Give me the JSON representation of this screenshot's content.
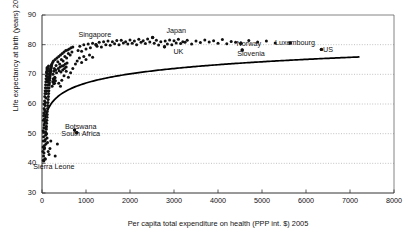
{
  "chart_data": {
    "type": "scatter",
    "title": "",
    "xlabel": "Per capita total expenditure on health (PPP int. $) 2005",
    "ylabel": "Life expectancy at birth (years) 2006",
    "xlim": [
      0,
      8000
    ],
    "ylim": [
      30,
      90
    ],
    "xticks": [
      0,
      1000,
      2000,
      3000,
      4000,
      5000,
      6000,
      7000,
      8000
    ],
    "yticks": [
      30,
      40,
      50,
      60,
      70,
      80,
      90
    ],
    "grid": "horizontal-dotted",
    "legend": "none",
    "marker_color": "#111111",
    "trend_color": "#000000",
    "trend_note": "Logarithmic fit curve rising steeply below 1000 then flattening toward 86 years at 7200",
    "annotations": [
      {
        "label": "Singapore",
        "x": 1200,
        "y": 83.5,
        "point_x": 1228,
        "point_y": 80.0
      },
      {
        "label": "Japan",
        "x": 3050,
        "y": 85.0,
        "point_x": 2514,
        "point_y": 82.4
      },
      {
        "label": "UK",
        "x": 3100,
        "y": 78.0,
        "point_x": 2784,
        "point_y": 79.3
      },
      {
        "label": "Norway",
        "x": 4700,
        "y": 80.7,
        "point_x": 4520,
        "point_y": 80.5
      },
      {
        "label": "Slovenia",
        "x": 4750,
        "y": 77.3,
        "point_x": 4550,
        "point_y": 78.2
      },
      {
        "label": "Luxembourg",
        "x": 5750,
        "y": 80.8,
        "point_x": 5640,
        "point_y": 80.6
      },
      {
        "label": "US",
        "x": 6500,
        "y": 78.6,
        "point_x": 6350,
        "point_y": 78.4
      },
      {
        "label": "Botswana",
        "x": 880,
        "y": 52.5,
        "point_x": 740,
        "point_y": 51.2
      },
      {
        "label": "South Africa",
        "x": 880,
        "y": 50.1,
        "point_x": 790,
        "point_y": 50.3
      },
      {
        "label": "Sierra Leone",
        "x": 270,
        "y": 39.2,
        "point_x": 70,
        "point_y": 41.5
      }
    ],
    "points": [
      [
        30,
        41.0
      ],
      [
        35,
        42.5
      ],
      [
        40,
        40.8
      ],
      [
        45,
        43.5
      ],
      [
        50,
        44.8
      ],
      [
        55,
        46.0
      ],
      [
        60,
        45.2
      ],
      [
        65,
        47.5
      ],
      [
        70,
        41.5
      ],
      [
        75,
        48.0
      ],
      [
        80,
        49.5
      ],
      [
        85,
        50.5
      ],
      [
        90,
        46.5
      ],
      [
        95,
        51.5
      ],
      [
        100,
        52.5
      ],
      [
        105,
        53.5
      ],
      [
        110,
        54.5
      ],
      [
        115,
        55.5
      ],
      [
        118,
        56.5
      ],
      [
        120,
        57.5
      ],
      [
        125,
        58.5
      ],
      [
        130,
        59.5
      ],
      [
        135,
        60.5
      ],
      [
        140,
        61.5
      ],
      [
        145,
        62.5
      ],
      [
        150,
        63.5
      ],
      [
        155,
        64.5
      ],
      [
        160,
        65.5
      ],
      [
        165,
        66.5
      ],
      [
        170,
        67.2
      ],
      [
        175,
        68.0
      ],
      [
        180,
        68.8
      ],
      [
        185,
        69.5
      ],
      [
        190,
        70.2
      ],
      [
        195,
        70.8
      ],
      [
        200,
        71.4
      ],
      [
        205,
        72.0
      ],
      [
        210,
        72.5
      ],
      [
        215,
        73.0
      ],
      [
        220,
        73.4
      ],
      [
        60,
        58.0
      ],
      [
        70,
        59.5
      ],
      [
        80,
        60.5
      ],
      [
        90,
        62.0
      ],
      [
        100,
        63.5
      ],
      [
        110,
        64.5
      ],
      [
        120,
        65.5
      ],
      [
        130,
        66.5
      ],
      [
        140,
        67.5
      ],
      [
        150,
        68.5
      ],
      [
        160,
        69.2
      ],
      [
        170,
        70.0
      ],
      [
        180,
        70.8
      ],
      [
        190,
        71.5
      ],
      [
        200,
        72.2
      ],
      [
        210,
        72.8
      ],
      [
        55,
        55.0
      ],
      [
        65,
        56.5
      ],
      [
        75,
        57.5
      ],
      [
        85,
        54.0
      ],
      [
        95,
        52.0
      ],
      [
        105,
        50.0
      ],
      [
        115,
        48.5
      ],
      [
        125,
        47.0
      ],
      [
        240,
        74.0
      ],
      [
        260,
        74.5
      ],
      [
        280,
        72.0
      ],
      [
        300,
        75.0
      ],
      [
        320,
        73.0
      ],
      [
        340,
        75.5
      ],
      [
        360,
        74.2
      ],
      [
        380,
        76.0
      ],
      [
        400,
        73.5
      ],
      [
        420,
        76.5
      ],
      [
        440,
        75.0
      ],
      [
        460,
        77.0
      ],
      [
        480,
        74.5
      ],
      [
        500,
        77.5
      ],
      [
        520,
        76.0
      ],
      [
        540,
        78.0
      ],
      [
        560,
        75.5
      ],
      [
        580,
        78.2
      ],
      [
        600,
        77.0
      ],
      [
        620,
        78.5
      ],
      [
        640,
        76.5
      ],
      [
        660,
        79.0
      ],
      [
        680,
        77.5
      ],
      [
        700,
        79.2
      ],
      [
        740,
        51.2
      ],
      [
        790,
        50.3
      ],
      [
        350,
        46.5
      ],
      [
        300,
        42.5
      ],
      [
        180,
        45.0
      ],
      [
        160,
        43.0
      ],
      [
        140,
        44.0
      ],
      [
        200,
        47.5
      ],
      [
        820,
        78.0
      ],
      [
        860,
        79.5
      ],
      [
        900,
        77.8
      ],
      [
        950,
        80.0
      ],
      [
        1000,
        78.5
      ],
      [
        1050,
        80.2
      ],
      [
        1100,
        79.0
      ],
      [
        1150,
        80.5
      ],
      [
        1228,
        80.0
      ],
      [
        1250,
        79.5
      ],
      [
        1300,
        80.8
      ],
      [
        1350,
        79.2
      ],
      [
        1400,
        81.0
      ],
      [
        1450,
        80.0
      ],
      [
        1500,
        81.2
      ],
      [
        1550,
        79.8
      ],
      [
        1600,
        81.0
      ],
      [
        1650,
        80.3
      ],
      [
        1700,
        81.4
      ],
      [
        1750,
        80.0
      ],
      [
        1800,
        81.5
      ],
      [
        1850,
        80.6
      ],
      [
        1900,
        81.0
      ],
      [
        1950,
        80.2
      ],
      [
        2000,
        81.6
      ],
      [
        2050,
        80.5
      ],
      [
        2100,
        81.2
      ],
      [
        2150,
        80.0
      ],
      [
        2200,
        81.8
      ],
      [
        2250,
        80.8
      ],
      [
        2300,
        81.3
      ],
      [
        2350,
        80.4
      ],
      [
        2400,
        81.9
      ],
      [
        2450,
        80.9
      ],
      [
        2514,
        82.4
      ],
      [
        2550,
        80.5
      ],
      [
        2600,
        81.5
      ],
      [
        2650,
        79.9
      ],
      [
        2700,
        81.0
      ],
      [
        2784,
        79.3
      ],
      [
        2800,
        81.2
      ],
      [
        2850,
        80.2
      ],
      [
        2900,
        81.6
      ],
      [
        2950,
        80.0
      ],
      [
        3000,
        81.3
      ],
      [
        3050,
        80.6
      ],
      [
        3100,
        81.8
      ],
      [
        3150,
        80.4
      ],
      [
        3200,
        81.0
      ],
      [
        3250,
        80.8
      ],
      [
        3300,
        81.5
      ],
      [
        3400,
        80.2
      ],
      [
        3500,
        81.2
      ],
      [
        3600,
        80.7
      ],
      [
        3700,
        81.6
      ],
      [
        3800,
        80.9
      ],
      [
        3900,
        81.3
      ],
      [
        4000,
        80.5
      ],
      [
        4100,
        81.7
      ],
      [
        4200,
        80.3
      ],
      [
        4300,
        81.1
      ],
      [
        4400,
        80.8
      ],
      [
        4520,
        80.5
      ],
      [
        4550,
        78.2
      ],
      [
        4700,
        81.4
      ],
      [
        4900,
        80.9
      ],
      [
        5100,
        81.2
      ],
      [
        5300,
        80.6
      ],
      [
        5640,
        80.6
      ],
      [
        6350,
        78.4
      ],
      [
        250,
        70.0
      ],
      [
        270,
        71.0
      ],
      [
        290,
        69.0
      ],
      [
        310,
        71.5
      ],
      [
        330,
        70.5
      ],
      [
        370,
        72.0
      ],
      [
        390,
        71.2
      ],
      [
        410,
        72.5
      ],
      [
        430,
        70.8
      ],
      [
        450,
        72.8
      ],
      [
        470,
        71.5
      ],
      [
        490,
        73.0
      ],
      [
        510,
        72.0
      ],
      [
        530,
        73.5
      ],
      [
        550,
        72.5
      ],
      [
        570,
        73.8
      ],
      [
        230,
        66.0
      ],
      [
        245,
        67.5
      ],
      [
        255,
        68.5
      ],
      [
        265,
        66.8
      ],
      [
        275,
        68.0
      ],
      [
        285,
        67.0
      ],
      [
        295,
        68.8
      ],
      [
        305,
        67.8
      ],
      [
        45,
        52.0
      ],
      [
        50,
        53.0
      ],
      [
        40,
        50.5
      ],
      [
        35,
        49.0
      ],
      [
        30,
        47.5
      ],
      [
        25,
        45.5
      ],
      [
        20,
        44.0
      ],
      [
        28,
        51.0
      ],
      [
        32,
        54.5
      ],
      [
        38,
        56.0
      ],
      [
        42,
        57.0
      ],
      [
        48,
        58.5
      ],
      [
        52,
        60.0
      ],
      [
        58,
        61.0
      ],
      [
        62,
        62.5
      ],
      [
        68,
        63.5
      ],
      [
        72,
        64.5
      ],
      [
        78,
        65.5
      ],
      [
        82,
        66.5
      ],
      [
        88,
        67.5
      ],
      [
        92,
        68.5
      ],
      [
        98,
        69.5
      ],
      [
        102,
        70.5
      ],
      [
        108,
        71.0
      ],
      [
        112,
        71.8
      ],
      [
        116,
        72.3
      ],
      [
        122,
        68.0
      ],
      [
        128,
        69.0
      ],
      [
        132,
        70.0
      ],
      [
        138,
        71.0
      ],
      [
        142,
        72.0
      ],
      [
        148,
        72.8
      ],
      [
        600,
        69.0
      ],
      [
        650,
        70.5
      ],
      [
        700,
        72.0
      ],
      [
        450,
        68.0
      ],
      [
        500,
        69.5
      ],
      [
        550,
        71.0
      ],
      [
        380,
        67.0
      ],
      [
        420,
        66.0
      ],
      [
        760,
        73.5
      ],
      [
        800,
        74.5
      ],
      [
        850,
        75.5
      ],
      [
        900,
        74.0
      ],
      [
        950,
        76.0
      ],
      [
        1000,
        75.0
      ],
      [
        1080,
        76.5
      ],
      [
        1150,
        75.8
      ]
    ]
  }
}
